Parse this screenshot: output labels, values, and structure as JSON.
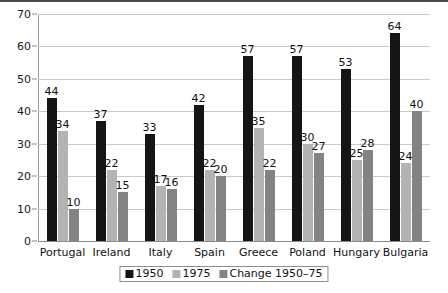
{
  "chart_data": {
    "type": "bar",
    "title": "",
    "subtitle": "",
    "xlabel": "",
    "ylabel": "",
    "ylim": [
      0,
      70
    ],
    "ytick_step": 10,
    "yticks": [
      0,
      10,
      20,
      30,
      40,
      50,
      60,
      70
    ],
    "grid": true,
    "legend_position": "bottom-center",
    "categories": [
      "Portugal",
      "Ireland",
      "Italy",
      "Spain",
      "Greece",
      "Poland",
      "Hungary",
      "Bulgaria"
    ],
    "series": [
      {
        "name": "1950",
        "color": "#151515",
        "values": [
          44,
          37,
          33,
          42,
          57,
          57,
          53,
          64
        ]
      },
      {
        "name": "1975",
        "color": "#b3b3b3",
        "values": [
          34,
          22,
          17,
          22,
          35,
          30,
          25,
          24
        ]
      },
      {
        "name": "Change 1950–75",
        "color": "#838383",
        "values": [
          10,
          15,
          16,
          20,
          22,
          27,
          28,
          40
        ]
      }
    ]
  },
  "legend": {
    "items": [
      {
        "label": "1950",
        "color": "#151515"
      },
      {
        "label": "1975",
        "color": "#b3b3b3"
      },
      {
        "label": "Change 1950–75",
        "color": "#838383"
      }
    ]
  },
  "colors": {
    "gridline": "#c9c9c9",
    "axis": "#8a8a8a",
    "text": "#111111",
    "background": "#ffffff",
    "top_rule": "#4a4a4a"
  }
}
